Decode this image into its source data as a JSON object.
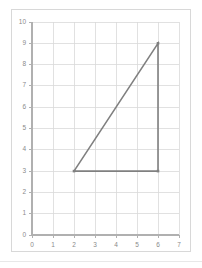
{
  "chart_data": {
    "type": "line",
    "title": "",
    "xlabel": "",
    "ylabel": "",
    "xlim": [
      0,
      7
    ],
    "ylim": [
      0,
      10
    ],
    "grid": true,
    "legend": null,
    "xticks": [
      "0",
      "1",
      "2",
      "3",
      "4",
      "5",
      "6",
      "7"
    ],
    "yticks": [
      "0",
      "1",
      "2",
      "3",
      "4",
      "5",
      "6",
      "7",
      "8",
      "9",
      "10"
    ],
    "xtick_values": [
      0,
      1,
      2,
      3,
      4,
      5,
      6,
      7
    ],
    "ytick_values": [
      0,
      1,
      2,
      3,
      4,
      5,
      6,
      7,
      8,
      9,
      10
    ],
    "series": [
      {
        "name": "triangle",
        "kind": "closed-polygon",
        "color": "#808080",
        "linewidth": 1.6,
        "marker": "square",
        "points": [
          {
            "x": 2,
            "y": 3
          },
          {
            "x": 6,
            "y": 9
          },
          {
            "x": 6,
            "y": 3
          },
          {
            "x": 2,
            "y": 3
          }
        ]
      }
    ],
    "vertices": [
      {
        "x": 2,
        "y": 3,
        "label": ""
      },
      {
        "x": 6,
        "y": 9,
        "label": ""
      },
      {
        "x": 6,
        "y": 3,
        "label": ""
      }
    ],
    "annotations": []
  },
  "style": {
    "grid_color": "#d9d9d9",
    "axis_color": "#b0b0b0",
    "tick_text_color": "#8a8a8a",
    "line_color": "#808080",
    "frame_color": "#d8d8d8",
    "background": "#ffffff"
  }
}
